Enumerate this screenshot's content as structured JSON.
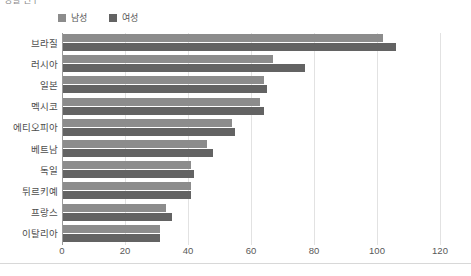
{
  "title_strip": "성별 인구",
  "legend": {
    "position": "top-left",
    "items": [
      {
        "label": "남성",
        "color": "#8c8c8c",
        "icon": "legend-swatch"
      },
      {
        "label": "여성",
        "color": "#636363",
        "icon": "legend-swatch"
      }
    ]
  },
  "axis": {
    "x_ticks": [
      "0",
      "20",
      "40",
      "60",
      "80",
      "100",
      "120"
    ],
    "x_min": 0,
    "x_max": 120,
    "grid": true
  },
  "colors": {
    "male": "#8c8c8c",
    "female": "#636363",
    "grid": "#e2e2e2",
    "axis": "#9a9a9a",
    "text": "#555555"
  },
  "chart_data": {
    "type": "bar",
    "orientation": "horizontal",
    "title": "성별 인구",
    "xlabel": "",
    "ylabel": "",
    "xlim": [
      0,
      120
    ],
    "grid": true,
    "legend_position": "top-left",
    "categories": [
      "브라질",
      "러시아",
      "일본",
      "멕시코",
      "에티오피아",
      "베트남",
      "독일",
      "튀르키예",
      "프랑스",
      "이탈리아"
    ],
    "series": [
      {
        "name": "남성",
        "color": "#8c8c8c",
        "values": [
          102,
          67,
          64,
          63,
          54,
          46,
          41,
          41,
          33,
          31
        ]
      },
      {
        "name": "여성",
        "color": "#636363",
        "values": [
          106,
          77,
          65,
          64,
          55,
          48,
          42,
          41,
          35,
          31
        ]
      }
    ]
  }
}
